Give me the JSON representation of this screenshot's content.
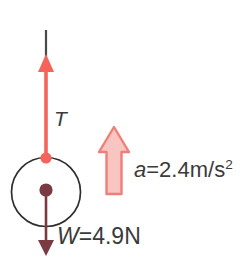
{
  "diagram": {
    "background_color": "#ffffff",
    "colors": {
      "tension_arrow": "#f4645a",
      "tension_pivot_dot": "#f4645a",
      "string_line": "#4a4a4a",
      "circle_outline": "#2e2e2e",
      "weight_arrow": "#7a3a42",
      "center_dot": "#7a3a42",
      "block_arrow_fill": "#f9c5c0",
      "block_arrow_stroke": "#ef7f78",
      "text": "#3b3b3b"
    },
    "labels": {
      "tension": "T",
      "acceleration_symbol": "a",
      "acceleration_equals": "=",
      "acceleration_value": "2.4m/s",
      "acceleration_exponent": "2",
      "weight_symbol": "W",
      "weight_equals": "=",
      "weight_value": "4.9N"
    },
    "elements": {
      "string": "string-line",
      "tension_arrow": "tension-force-arrow-up",
      "weight_arrow": "weight-force-arrow-down",
      "block_arrow": "acceleration-block-arrow-up",
      "body": "mass-circle",
      "center_dot": "center-of-mass-dot",
      "attachment_dot": "string-attachment-dot"
    }
  }
}
